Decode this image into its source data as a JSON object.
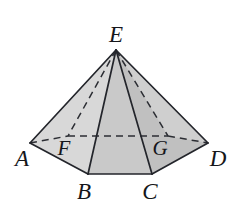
{
  "figure": {
    "name": "hexagonal-pyramid",
    "background_color": "#ffffff",
    "stroke_color": "#23252b",
    "dashed_stroke_color": "#2b2d33",
    "canvas": {
      "width": 245,
      "height": 220
    }
  },
  "faces": [
    {
      "name": "face-E-A-F",
      "points": "116,50 30,143 68,136",
      "fill": "#dedede"
    },
    {
      "name": "face-E-A-B",
      "points": "116,50 30,143 88,174",
      "fill": "#d8d8d8"
    },
    {
      "name": "face-E-B-C",
      "points": "116,50 88,174 152,174",
      "fill": "#c9c9c9"
    },
    {
      "name": "face-E-C-D",
      "points": "116,50 152,174 208,143",
      "fill": "#c0c0c0"
    },
    {
      "name": "face-E-G-D",
      "points": "116,50 168,136 208,143",
      "fill": "#cfcfcf"
    },
    {
      "name": "face-base-front",
      "points": "30,143 88,174 152,174 208,143 168,136 68,136",
      "fill": "#d4d4d4"
    }
  ],
  "edges": {
    "solid": [
      {
        "name": "edge-E-A",
        "x1": 116,
        "y1": 50,
        "x2": 30,
        "y2": 143
      },
      {
        "name": "edge-E-B",
        "x1": 116,
        "y1": 50,
        "x2": 88,
        "y2": 174
      },
      {
        "name": "edge-E-C",
        "x1": 116,
        "y1": 50,
        "x2": 152,
        "y2": 174
      },
      {
        "name": "edge-E-D",
        "x1": 116,
        "y1": 50,
        "x2": 208,
        "y2": 143
      },
      {
        "name": "edge-A-B",
        "x1": 30,
        "y1": 143,
        "x2": 88,
        "y2": 174
      },
      {
        "name": "edge-B-C",
        "x1": 88,
        "y1": 174,
        "x2": 152,
        "y2": 174
      },
      {
        "name": "edge-C-D",
        "x1": 152,
        "y1": 174,
        "x2": 208,
        "y2": 143
      }
    ],
    "dashed": [
      {
        "name": "edge-E-F",
        "x1": 116,
        "y1": 50,
        "x2": 68,
        "y2": 136
      },
      {
        "name": "edge-E-G",
        "x1": 116,
        "y1": 50,
        "x2": 168,
        "y2": 136
      },
      {
        "name": "edge-A-F",
        "x1": 30,
        "y1": 143,
        "x2": 68,
        "y2": 136
      },
      {
        "name": "edge-F-G",
        "x1": 68,
        "y1": 136,
        "x2": 168,
        "y2": 136
      },
      {
        "name": "edge-G-D",
        "x1": 168,
        "y1": 136,
        "x2": 208,
        "y2": 143
      }
    ]
  },
  "labels": {
    "apex": {
      "text": "E",
      "x": 116,
      "y": 42
    },
    "a": {
      "text": "A",
      "x": 22,
      "y": 166
    },
    "b": {
      "text": "B",
      "x": 84,
      "y": 199
    },
    "c": {
      "text": "C",
      "x": 150,
      "y": 199
    },
    "d": {
      "text": "D",
      "x": 218,
      "y": 166
    },
    "f": {
      "text": "F",
      "x": 64,
      "y": 155
    },
    "g": {
      "text": "G",
      "x": 160,
      "y": 155
    }
  }
}
